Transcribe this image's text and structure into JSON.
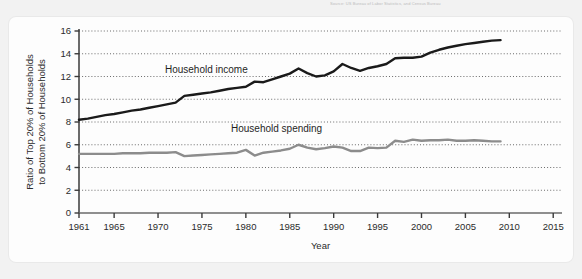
{
  "top_caption": "Source: US Bureau of Labor Statistics, and Census Bureau",
  "chart_data": {
    "type": "line",
    "title": "",
    "xlabel": "Year",
    "ylabel": "Ratio of Top 20% of Households to Bottom 20% of Households",
    "ylabel_line1": "Ratio of Top 20% of Households",
    "ylabel_line2": "to Bottom 20% of Households",
    "xlim": [
      1961,
      2016
    ],
    "ylim": [
      0,
      16
    ],
    "xticks": [
      1961,
      1965,
      1970,
      1975,
      1980,
      1985,
      1990,
      1995,
      2000,
      2005,
      2010,
      2015
    ],
    "xtick_labels": [
      "1961",
      "1965",
      "1970",
      "1975",
      "1980",
      "1985",
      "1990",
      "1995",
      "2000",
      "2005",
      "2010",
      "2015"
    ],
    "yticks": [
      0,
      2,
      4,
      6,
      8,
      10,
      12,
      14,
      16
    ],
    "ytick_labels": [
      "0",
      "2",
      "4",
      "6",
      "8",
      "10",
      "12",
      "14",
      "16"
    ],
    "grid": "horizontal-dotted",
    "legend_position": "inline-annotation",
    "series": [
      {
        "name": "Household income",
        "color": "#1a1a1a",
        "line_width": 2.4,
        "label_x": 1975.5,
        "label_y": 12.35,
        "x": [
          1961,
          1962,
          1963,
          1964,
          1965,
          1966,
          1967,
          1968,
          1969,
          1970,
          1971,
          1972,
          1973,
          1974,
          1975,
          1976,
          1977,
          1978,
          1979,
          1980,
          1981,
          1982,
          1983,
          1984,
          1985,
          1986,
          1987,
          1988,
          1989,
          1990,
          1991,
          1992,
          1993,
          1994,
          1995,
          1996,
          1997,
          1998,
          1999,
          2000,
          2001,
          2002,
          2003,
          2004,
          2005,
          2006,
          2007,
          2008,
          2009
        ],
        "values": [
          8.2,
          8.3,
          8.45,
          8.6,
          8.7,
          8.85,
          9.0,
          9.1,
          9.25,
          9.4,
          9.55,
          9.7,
          10.3,
          10.4,
          10.5,
          10.6,
          10.75,
          10.9,
          11.0,
          11.1,
          11.55,
          11.5,
          11.75,
          12.0,
          12.25,
          12.7,
          12.3,
          12.0,
          12.1,
          12.45,
          13.1,
          12.75,
          12.5,
          12.75,
          12.9,
          13.1,
          13.6,
          13.65,
          13.65,
          13.75,
          14.1,
          14.35,
          14.55,
          14.7,
          14.85,
          14.95,
          15.05,
          15.15,
          15.2
        ]
      },
      {
        "name": "Household spending",
        "color": "#8c8c8c",
        "line_width": 2.4,
        "label_x": 1983.5,
        "label_y": 7.15,
        "x": [
          1961,
          1962,
          1963,
          1964,
          1965,
          1966,
          1967,
          1968,
          1969,
          1970,
          1971,
          1972,
          1973,
          1974,
          1975,
          1976,
          1977,
          1978,
          1979,
          1980,
          1981,
          1982,
          1983,
          1984,
          1985,
          1986,
          1987,
          1988,
          1989,
          1990,
          1991,
          1992,
          1993,
          1994,
          1995,
          1996,
          1997,
          1998,
          1999,
          2000,
          2001,
          2002,
          2003,
          2004,
          2005,
          2006,
          2007,
          2008,
          2009
        ],
        "values": [
          5.2,
          5.2,
          5.2,
          5.2,
          5.2,
          5.25,
          5.25,
          5.25,
          5.3,
          5.3,
          5.3,
          5.35,
          5.0,
          5.05,
          5.1,
          5.15,
          5.2,
          5.25,
          5.3,
          5.55,
          5.05,
          5.3,
          5.4,
          5.5,
          5.65,
          6.0,
          5.75,
          5.6,
          5.7,
          5.85,
          5.75,
          5.45,
          5.45,
          5.75,
          5.7,
          5.75,
          6.35,
          6.25,
          6.45,
          6.35,
          6.4,
          6.4,
          6.45,
          6.35,
          6.35,
          6.4,
          6.35,
          6.3,
          6.3
        ]
      }
    ]
  }
}
